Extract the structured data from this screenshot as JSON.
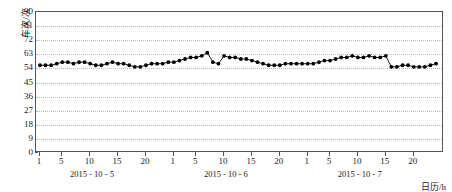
{
  "chart_data": {
    "type": "line",
    "title": "",
    "subtitle": "",
    "xlabel": "日历/h",
    "ylabel": "车次/次",
    "ylim": [
      0,
      90
    ],
    "ytick_values": [
      0,
      9,
      18,
      27,
      36,
      45,
      54,
      63,
      72,
      81,
      90
    ],
    "ytick_labels": [
      "0",
      "9",
      "18",
      "27",
      "36",
      "45",
      "54",
      "63",
      "72",
      "81",
      "90"
    ],
    "grid": "horizontal-dotted",
    "legend": "none",
    "marker": "filled-circle",
    "line_color": "#000000",
    "marker_color": "#000000",
    "grid_color": "#b9b9b9",
    "axis_color": "#555555",
    "xlim": [
      1,
      72
    ],
    "xtick_values": [
      1,
      5,
      10,
      15,
      20,
      25,
      29,
      34,
      39,
      44,
      49,
      53,
      58,
      63,
      68
    ],
    "xtick_labels": [
      "1",
      "5",
      "10",
      "15",
      "20",
      "1",
      "5",
      "10",
      "15",
      "20",
      "1",
      "5",
      "10",
      "15",
      "20"
    ],
    "day_groups": [
      {
        "label": "2015 - 10 - 5",
        "center_x": 10.5
      },
      {
        "label": "2015 - 10 - 6",
        "center_x": 34.5
      },
      {
        "label": "2015 - 10 - 7",
        "center_x": 58.5
      }
    ],
    "x": [
      1,
      2,
      3,
      4,
      5,
      6,
      7,
      8,
      9,
      10,
      11,
      12,
      13,
      14,
      15,
      16,
      17,
      18,
      19,
      20,
      21,
      22,
      23,
      24,
      25,
      26,
      27,
      28,
      29,
      30,
      31,
      32,
      33,
      34,
      35,
      36,
      37,
      38,
      39,
      40,
      41,
      42,
      43,
      44,
      45,
      46,
      47,
      48,
      49,
      50,
      51,
      52,
      53,
      54,
      55,
      56,
      57,
      58,
      59,
      60,
      61,
      62,
      63,
      64,
      65,
      66,
      67,
      68,
      69,
      70,
      71,
      72
    ],
    "values": [
      56,
      56,
      56,
      57,
      58,
      58,
      57,
      58,
      58,
      57,
      56,
      56,
      57,
      58,
      57,
      57,
      56,
      55,
      55,
      56,
      57,
      57,
      57,
      58,
      58,
      59,
      60,
      61,
      61,
      62,
      64,
      58,
      57,
      62,
      61,
      61,
      60,
      60,
      59,
      58,
      57,
      56,
      56,
      56,
      57,
      57,
      57,
      57,
      57,
      57,
      58,
      59,
      59,
      60,
      61,
      61,
      62,
      61,
      61,
      62,
      61,
      61,
      62,
      55,
      55,
      56,
      56,
      55,
      55,
      55,
      56,
      57
    ],
    "value_axis_note": "vehicle trips per hour"
  },
  "axes": {
    "y_title": "车次/次",
    "x_title": "日历/h"
  }
}
